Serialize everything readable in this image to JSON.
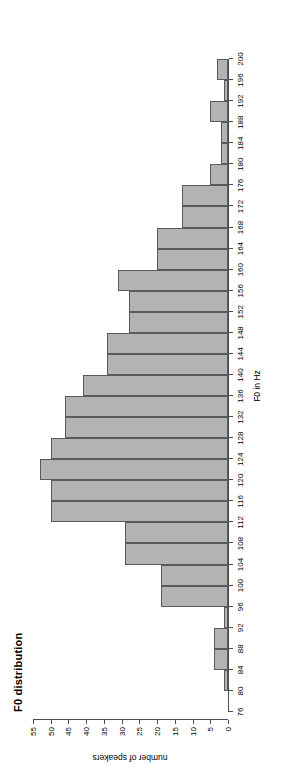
{
  "chart_data": {
    "type": "bar",
    "title": "F0 distribution",
    "xlabel": "F0 in Hz",
    "ylabel": "number of speakers",
    "xlim": [
      76,
      200
    ],
    "ylim": [
      0,
      55
    ],
    "bin_width": 4,
    "grid": false,
    "legend": false,
    "bar_fill_color": "#b3b3b3",
    "bar_border_color": "#5a5a5a",
    "xticks": [
      76,
      80,
      84,
      88,
      92,
      96,
      100,
      104,
      108,
      112,
      116,
      120,
      124,
      128,
      132,
      136,
      140,
      144,
      148,
      152,
      156,
      160,
      164,
      168,
      172,
      176,
      180,
      184,
      188,
      192,
      196,
      200
    ],
    "yticks": [
      0,
      5,
      10,
      15,
      20,
      25,
      30,
      35,
      40,
      45,
      50,
      55
    ],
    "categories": [
      "76-80",
      "80-84",
      "84-88",
      "88-92",
      "92-96",
      "96-100",
      "100-104",
      "104-108",
      "108-112",
      "112-116",
      "116-120",
      "120-124",
      "124-128",
      "128-132",
      "132-136",
      "136-140",
      "140-144",
      "144-148",
      "148-152",
      "152-156",
      "156-160",
      "160-164",
      "164-168",
      "168-172",
      "172-176",
      "176-180",
      "180-184",
      "184-188",
      "188-192",
      "192-196",
      "196-200"
    ],
    "bins": [
      {
        "start": 76,
        "end": 80,
        "value": 0
      },
      {
        "start": 80,
        "end": 84,
        "value": 1
      },
      {
        "start": 84,
        "end": 88,
        "value": 4
      },
      {
        "start": 88,
        "end": 92,
        "value": 4
      },
      {
        "start": 92,
        "end": 96,
        "value": 1
      },
      {
        "start": 96,
        "end": 100,
        "value": 19
      },
      {
        "start": 100,
        "end": 104,
        "value": 19
      },
      {
        "start": 104,
        "end": 108,
        "value": 29
      },
      {
        "start": 108,
        "end": 112,
        "value": 29
      },
      {
        "start": 112,
        "end": 116,
        "value": 50
      },
      {
        "start": 116,
        "end": 120,
        "value": 50
      },
      {
        "start": 120,
        "end": 124,
        "value": 53
      },
      {
        "start": 124,
        "end": 128,
        "value": 50
      },
      {
        "start": 128,
        "end": 132,
        "value": 46
      },
      {
        "start": 132,
        "end": 136,
        "value": 46
      },
      {
        "start": 136,
        "end": 140,
        "value": 41
      },
      {
        "start": 140,
        "end": 144,
        "value": 34
      },
      {
        "start": 144,
        "end": 148,
        "value": 34
      },
      {
        "start": 148,
        "end": 152,
        "value": 28
      },
      {
        "start": 152,
        "end": 156,
        "value": 28
      },
      {
        "start": 156,
        "end": 160,
        "value": 31
      },
      {
        "start": 160,
        "end": 164,
        "value": 20
      },
      {
        "start": 164,
        "end": 168,
        "value": 20
      },
      {
        "start": 168,
        "end": 172,
        "value": 13
      },
      {
        "start": 172,
        "end": 176,
        "value": 13
      },
      {
        "start": 176,
        "end": 180,
        "value": 5
      },
      {
        "start": 180,
        "end": 184,
        "value": 2
      },
      {
        "start": 184,
        "end": 188,
        "value": 2
      },
      {
        "start": 188,
        "end": 192,
        "value": 5
      },
      {
        "start": 192,
        "end": 196,
        "value": 1
      },
      {
        "start": 196,
        "end": 200,
        "value": 3
      }
    ]
  }
}
